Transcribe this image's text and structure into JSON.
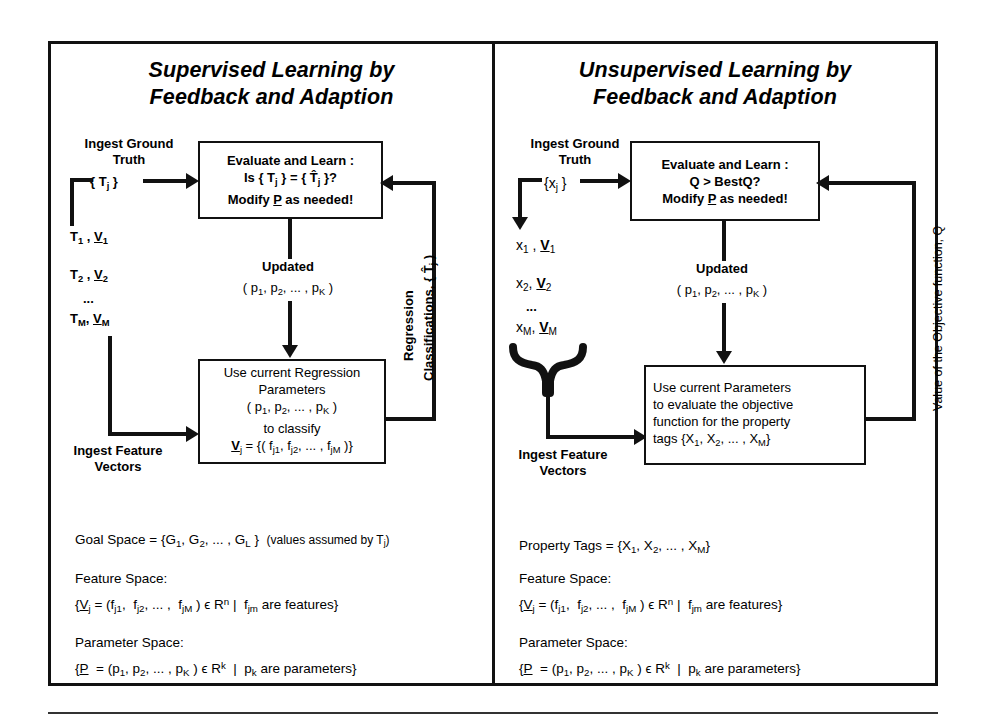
{
  "figure": {
    "type": "diagram",
    "title_left": "Supervised Learning by Feedback and Adaption",
    "title_right": "Unsupervised Learning by Feedback and Adaption"
  },
  "left_panel": {
    "title_line1": "Supervised Learning by",
    "title_line2": "Feedback and Adaption",
    "ingest_truth_line1": "Ingest Ground",
    "ingest_truth_line2": "Truth",
    "truth_set": "{ Tj }",
    "data_rows": [
      "T1 , V1",
      "T2 , V2",
      "...",
      "TM , VM"
    ],
    "ingest_features_line1": "Ingest Feature",
    "ingest_features_line2": "Vectors",
    "evaluate_box": {
      "line1": "Evaluate and Learn :",
      "line2": "Is { Tj } = { T̂j }?",
      "line3": "Modify P as needed!"
    },
    "updated_label": "Updated",
    "updated_params": "( p1, p2, ... , pK )",
    "process_box": {
      "line1": "Use current Regression",
      "line2": "Parameters",
      "line3": "( p1, p2, ... , pK )",
      "line4": "to classify",
      "line5": "Vj = {( f j1, f j2, ... , f jM )}"
    },
    "feedback_label_line1": "Regression",
    "feedback_label_line2": "Classifications, { T̂j }",
    "formulas": {
      "goal_space": "Goal Space = {G1, G2, ... , GL }  (values assumed by Tj)",
      "feature_space_title": "Feature Space:",
      "feature_space_body": "{ Vj = (f j1,  f j2, ... ,  f jM ) ϵ R n | f jm are features}",
      "parameter_space_title": "Parameter Space:",
      "parameter_space_body": "{ P  = (p1, p2, ... , pK ) ϵ R k | pk are parameters}"
    }
  },
  "right_panel": {
    "title_line1": "Unsupervised Learning by",
    "title_line2": "Feedback and Adaption",
    "ingest_truth_line1": "Ingest Ground",
    "ingest_truth_line2": "Truth",
    "truth_set": "{xj }",
    "data_rows": [
      "x1 , V1",
      "x2 , V2",
      "...",
      "xM , VM"
    ],
    "ingest_features_line1": "Ingest Feature",
    "ingest_features_line2": "Vectors",
    "evaluate_box": {
      "line1": "Evaluate and Learn :",
      "line2": "Q > BestQ?",
      "line3": "Modify P as needed!"
    },
    "updated_label": "Updated",
    "updated_params": "( p1, p2, ... , pK )",
    "process_box": {
      "line1": "Use current Parameters",
      "line2": "to evaluate the objective",
      "line3": "function for the property",
      "line4": "tags {X1, X2, ... , XM}"
    },
    "feedback_label": "Value of the Objective function, Q",
    "formulas": {
      "property_tags": "Property Tags = {X1, X2, ... , XM}",
      "feature_space_title": "Feature Space:",
      "feature_space_body": "{ Vj = (f j1,  f j2, ... ,  f jM ) ϵ R n | f jm are features}",
      "parameter_space_title": "Parameter Space:",
      "parameter_space_body": "{ P  = (p1, p2, ... , pK ) ϵ R k | pk are parameters}"
    }
  },
  "colors": {
    "ink": "#111111",
    "background": "#ffffff"
  }
}
